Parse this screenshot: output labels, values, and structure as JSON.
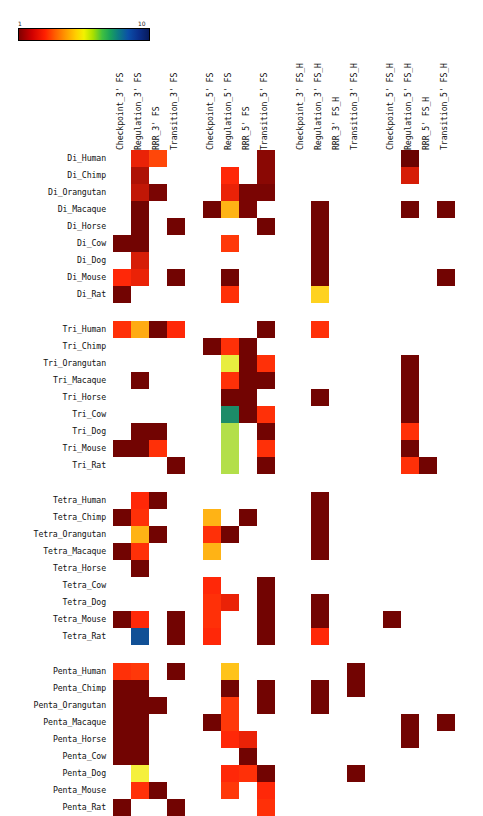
{
  "colorbar": {
    "min_label": "1",
    "max_label": "10",
    "colormap": "jet-like (dark red → red → orange → yellow → green → blue → dark navy)"
  },
  "chart_data": {
    "type": "heatmap",
    "title": "",
    "xlabel": "",
    "ylabel": "",
    "cmap_range": [
      1,
      10
    ],
    "grid": false,
    "legend_position": "top-left colorbar",
    "column_groups": [
      {
        "name": "FS_3prime",
        "columns": [
          "Checkpoint_3' FS",
          "Regulation_3' FS",
          "RRR_3' FS",
          "Transition_3' FS"
        ]
      },
      {
        "name": "FS_5prime",
        "columns": [
          "Checkpoint_5' FS",
          "Regulation_5' FS",
          "RRR_5' FS",
          "Transition_5' FS"
        ]
      },
      {
        "name": "FS_H_3prime",
        "columns": [
          "Checkpoint_3' FS_H",
          "Regulation_3' FS_H",
          "RRR_3' FS_H",
          "Transition_3' FS_H"
        ]
      },
      {
        "name": "FS_H_5prime",
        "columns": [
          "Checkpoint_5' FS_H",
          "Regulation_5' FS_H",
          "RRR_5' FS_H",
          "Transition_5' FS_H"
        ]
      }
    ],
    "columns": [
      "Checkpoint_3' FS",
      "Regulation_3' FS",
      "RRR_3' FS",
      "Transition_3' FS",
      "Checkpoint_5' FS",
      "Regulation_5' FS",
      "RRR_5' FS",
      "Transition_5' FS",
      "Checkpoint_3' FS_H",
      "Regulation_3' FS_H",
      "RRR_3' FS_H",
      "Transition_3' FS_H",
      "Checkpoint_5' FS_H",
      "Regulation_5' FS_H",
      "RRR_5' FS_H",
      "Transition_5' FS_H"
    ],
    "row_groups": [
      {
        "name": "Di",
        "rows": [
          "Di_Human",
          "Di_Chimp",
          "Di_Orangutan",
          "Di_Macaque",
          "Di_Horse",
          "Di_Cow",
          "Di_Dog",
          "Di_Mouse",
          "Di_Rat"
        ]
      },
      {
        "name": "Tri",
        "rows": [
          "Tri_Human",
          "Tri_Chimp",
          "Tri_Orangutan",
          "Tri_Macaque",
          "Tri_Horse",
          "Tri_Cow",
          "Tri_Dog",
          "Tri_Mouse",
          "Tri_Rat"
        ]
      },
      {
        "name": "Tetra",
        "rows": [
          "Tetra_Human",
          "Tetra_Chimp",
          "Tetra_Orangutan",
          "Tetra_Macaque",
          "Tetra_Horse",
          "Tetra_Cow",
          "Tetra_Dog",
          "Tetra_Mouse",
          "Tetra_Rat"
        ]
      },
      {
        "name": "Penta",
        "rows": [
          "Penta_Human",
          "Penta_Chimp",
          "Penta_Orangutan",
          "Penta_Macaque",
          "Penta_Horse",
          "Penta_Cow",
          "Penta_Dog",
          "Penta_Mouse",
          "Penta_Rat"
        ]
      }
    ],
    "rows": [
      "Di_Human",
      "Di_Chimp",
      "Di_Orangutan",
      "Di_Macaque",
      "Di_Horse",
      "Di_Cow",
      "Di_Dog",
      "Di_Mouse",
      "Di_Rat",
      "Tri_Human",
      "Tri_Chimp",
      "Tri_Orangutan",
      "Tri_Macaque",
      "Tri_Horse",
      "Tri_Cow",
      "Tri_Dog",
      "Tri_Mouse",
      "Tri_Rat",
      "Tetra_Human",
      "Tetra_Chimp",
      "Tetra_Orangutan",
      "Tetra_Macaque",
      "Tetra_Horse",
      "Tetra_Cow",
      "Tetra_Dog",
      "Tetra_Mouse",
      "Tetra_Rat",
      "Penta_Human",
      "Penta_Chimp",
      "Penta_Orangutan",
      "Penta_Macaque",
      "Penta_Horse",
      "Penta_Cow",
      "Penta_Dog",
      "Penta_Mouse",
      "Penta_Rat"
    ],
    "null_color": "#ffffff",
    "values": [
      [
        null,
        2.6,
        3.2,
        null,
        null,
        null,
        null,
        1.6,
        null,
        null,
        null,
        null,
        null,
        1.2,
        null,
        null
      ],
      [
        null,
        2.0,
        null,
        null,
        null,
        2.8,
        null,
        1.6,
        null,
        null,
        null,
        null,
        null,
        2.4,
        null,
        null
      ],
      [
        null,
        2.2,
        1.4,
        null,
        null,
        2.6,
        1.4,
        1.4,
        null,
        null,
        null,
        null,
        null,
        null,
        null,
        null
      ],
      [
        null,
        1.3,
        null,
        null,
        1.3,
        4.6,
        1.4,
        null,
        null,
        1.3,
        null,
        null,
        null,
        1.3,
        null,
        1.3
      ],
      [
        null,
        1.3,
        null,
        1.3,
        null,
        null,
        null,
        1.3,
        null,
        1.3,
        null,
        null,
        null,
        null,
        null,
        null
      ],
      [
        1.3,
        1.3,
        null,
        null,
        null,
        3.0,
        null,
        null,
        null,
        1.3,
        null,
        null,
        null,
        null,
        null,
        null
      ],
      [
        null,
        2.4,
        null,
        null,
        null,
        null,
        null,
        null,
        null,
        1.3,
        null,
        null,
        null,
        null,
        null,
        null
      ],
      [
        2.8,
        2.6,
        null,
        1.3,
        null,
        1.3,
        null,
        null,
        null,
        1.3,
        null,
        null,
        null,
        null,
        null,
        1.3
      ],
      [
        1.3,
        null,
        null,
        null,
        null,
        2.9,
        null,
        null,
        null,
        5.0,
        null,
        null,
        null,
        null,
        null,
        null
      ],
      [
        2.9,
        4.5,
        1.3,
        2.8,
        null,
        null,
        null,
        1.3,
        null,
        2.9,
        null,
        null,
        null,
        null,
        null,
        null
      ],
      [
        null,
        null,
        null,
        null,
        1.3,
        2.9,
        1.3,
        null,
        null,
        null,
        null,
        null,
        null,
        null,
        null,
        null
      ],
      [
        null,
        null,
        null,
        null,
        null,
        5.6,
        1.3,
        2.9,
        null,
        null,
        null,
        null,
        null,
        1.3,
        null,
        null
      ],
      [
        null,
        1.3,
        null,
        null,
        null,
        2.9,
        1.3,
        1.3,
        null,
        null,
        null,
        null,
        null,
        1.3,
        null,
        null
      ],
      [
        null,
        null,
        null,
        null,
        null,
        1.3,
        1.3,
        null,
        null,
        1.3,
        null,
        null,
        null,
        1.3,
        null,
        null
      ],
      [
        null,
        null,
        null,
        null,
        null,
        7.6,
        1.3,
        2.9,
        null,
        null,
        null,
        null,
        null,
        1.3,
        null,
        null
      ],
      [
        null,
        1.3,
        1.3,
        null,
        null,
        6.0,
        null,
        1.3,
        null,
        null,
        null,
        null,
        null,
        2.9,
        null,
        null
      ],
      [
        1.3,
        1.3,
        2.9,
        null,
        null,
        6.0,
        null,
        2.9,
        null,
        null,
        null,
        null,
        null,
        1.3,
        null,
        null
      ],
      [
        null,
        null,
        null,
        1.3,
        null,
        6.0,
        null,
        1.3,
        null,
        null,
        null,
        null,
        null,
        2.9,
        1.3,
        null
      ],
      [
        null,
        2.8,
        1.3,
        null,
        null,
        null,
        null,
        null,
        null,
        1.3,
        null,
        null,
        null,
        null,
        null,
        null
      ],
      [
        1.3,
        2.9,
        null,
        null,
        4.6,
        null,
        1.3,
        null,
        null,
        1.3,
        null,
        null,
        null,
        null,
        null,
        null
      ],
      [
        null,
        4.6,
        1.3,
        null,
        2.9,
        1.3,
        null,
        null,
        null,
        1.3,
        null,
        null,
        null,
        null,
        null,
        null
      ],
      [
        1.3,
        2.9,
        null,
        null,
        4.6,
        null,
        null,
        null,
        null,
        1.3,
        null,
        null,
        null,
        null,
        null,
        null
      ],
      [
        null,
        1.3,
        null,
        null,
        null,
        null,
        null,
        null,
        null,
        null,
        null,
        null,
        null,
        null,
        null,
        null
      ],
      [
        null,
        null,
        null,
        null,
        2.8,
        null,
        null,
        1.3,
        null,
        null,
        null,
        null,
        null,
        null,
        null,
        null
      ],
      [
        null,
        null,
        null,
        null,
        2.9,
        2.6,
        null,
        1.3,
        null,
        1.3,
        null,
        null,
        null,
        null,
        null,
        null
      ],
      [
        1.3,
        2.8,
        null,
        1.3,
        2.9,
        null,
        null,
        1.3,
        null,
        1.3,
        null,
        null,
        1.3,
        null,
        null,
        null
      ],
      [
        null,
        8.4,
        null,
        1.3,
        2.8,
        null,
        null,
        1.3,
        null,
        2.8,
        null,
        null,
        null,
        null,
        null,
        null
      ],
      [
        2.9,
        3.0,
        null,
        1.3,
        null,
        4.8,
        null,
        null,
        null,
        null,
        null,
        1.3,
        null,
        null,
        null,
        null
      ],
      [
        1.3,
        1.3,
        null,
        null,
        null,
        1.3,
        null,
        1.3,
        null,
        1.3,
        null,
        1.3,
        null,
        null,
        null,
        null
      ],
      [
        1.3,
        1.3,
        1.3,
        null,
        null,
        3.0,
        null,
        1.3,
        null,
        1.3,
        null,
        null,
        null,
        null,
        null,
        null
      ],
      [
        1.3,
        1.3,
        null,
        null,
        1.3,
        3.0,
        null,
        null,
        null,
        null,
        null,
        null,
        null,
        1.3,
        null,
        1.3
      ],
      [
        1.3,
        1.3,
        null,
        null,
        null,
        2.8,
        2.6,
        null,
        null,
        null,
        null,
        null,
        null,
        1.3,
        null,
        null
      ],
      [
        1.3,
        1.3,
        null,
        null,
        null,
        null,
        1.3,
        null,
        null,
        null,
        null,
        null,
        null,
        null,
        null,
        null
      ],
      [
        null,
        5.5,
        null,
        null,
        null,
        2.8,
        2.9,
        1.3,
        null,
        null,
        null,
        1.3,
        null,
        null,
        null,
        null
      ],
      [
        null,
        2.9,
        1.3,
        null,
        null,
        3.0,
        null,
        2.8,
        null,
        null,
        null,
        null,
        null,
        null,
        null,
        null
      ],
      [
        1.3,
        null,
        null,
        1.3,
        null,
        null,
        null,
        2.9,
        null,
        null,
        null,
        null,
        null,
        null,
        null,
        null
      ]
    ]
  }
}
